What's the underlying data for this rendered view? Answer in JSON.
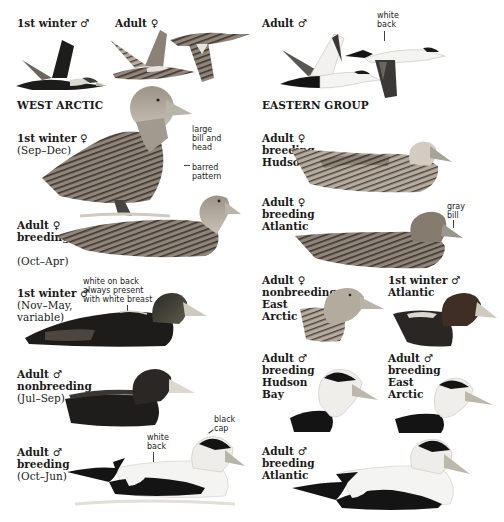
{
  "plate": {
    "species": "Common Eider",
    "sections": {
      "west": "WEST ARCTIC",
      "east": "EASTERN GROUP"
    },
    "flight": {
      "first_winter_male": {
        "title": "1st winter",
        "sex": "♂"
      },
      "adult_female": {
        "title": "Adult",
        "sex": "♀"
      },
      "adult_male": {
        "title": "Adult",
        "sex": "♂",
        "note": [
          "white",
          "back"
        ]
      }
    },
    "west_arctic": [
      {
        "title": "1st winter",
        "sex": "♀",
        "lines": [
          "(Sep–Dec)"
        ],
        "notes": [
          "large",
          "bill and",
          "head"
        ],
        "notes2": [
          "barred",
          "pattern"
        ]
      },
      {
        "title": "Adult",
        "sex": "♀",
        "lines_bold": [
          "breeding"
        ],
        "lines": [
          "(Oct–Apr)"
        ]
      },
      {
        "title": "1st winter",
        "sex": "♂",
        "lines": [
          "(Nov–May,",
          "variable)"
        ],
        "notes": [
          "white on back",
          "always present",
          "with white breast"
        ]
      },
      {
        "title": "Adult",
        "sex": "♂",
        "lines_bold": [
          "nonbreeding"
        ],
        "lines": [
          "(Jul–Sep)"
        ]
      },
      {
        "title": "Adult",
        "sex": "♂",
        "lines_bold": [
          "breeding"
        ],
        "lines": [
          "(Oct–Jun)"
        ],
        "notes": [
          "white",
          "back"
        ],
        "notes2": [
          "black",
          "cap"
        ]
      }
    ],
    "eastern_group": [
      {
        "title": "Adult",
        "sex": "♀",
        "lines_bold": [
          "breeding",
          "Hudson Bay"
        ]
      },
      {
        "title": "Adult",
        "sex": "♀",
        "lines_bold": [
          "breeding",
          "Atlantic"
        ],
        "notes": [
          "gray",
          "bill"
        ]
      },
      {
        "title": "Adult",
        "sex": "♀",
        "lines_bold": [
          "nonbreeding",
          "East",
          "Arctic"
        ]
      },
      {
        "title": "1st winter",
        "sex": "♂",
        "lines_bold": [
          "Atlantic"
        ]
      },
      {
        "title": "Adult",
        "sex": "♂",
        "lines_bold": [
          "breeding",
          "Hudson",
          "Bay"
        ]
      },
      {
        "title": "Adult",
        "sex": "♂",
        "lines_bold": [
          "breeding",
          "East",
          "Arctic"
        ]
      },
      {
        "title": "Adult",
        "sex": "♂",
        "lines_bold": [
          "breeding",
          "Atlantic"
        ]
      }
    ],
    "colors": {
      "female_brown": "#8a7f72",
      "female_bar": "#3d362f",
      "male_black": "#141414",
      "male_white": "#f4f4f2",
      "bill_gray": "#b9b4a8",
      "head_gray": "#c7c1b6"
    }
  }
}
